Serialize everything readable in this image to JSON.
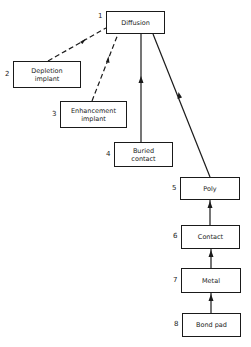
{
  "diagram": {
    "nodes": [
      {
        "id": "1",
        "label": "Diffusion"
      },
      {
        "id": "2",
        "label": "Depletion implant",
        "line1": "Depletion",
        "line2": "implant"
      },
      {
        "id": "3",
        "label": "Enhancement implant",
        "line1": "Enhancement",
        "line2": "implant"
      },
      {
        "id": "4",
        "label": "Buried contact",
        "line1": "Buried",
        "line2": "contact"
      },
      {
        "id": "5",
        "label": "Poly"
      },
      {
        "id": "6",
        "label": "Contact"
      },
      {
        "id": "7",
        "label": "Metal"
      },
      {
        "id": "8",
        "label": "Bond pad"
      }
    ],
    "edges": [
      {
        "from": "2",
        "to": "1",
        "style": "dashed"
      },
      {
        "from": "3",
        "to": "1",
        "style": "dashed"
      },
      {
        "from": "4",
        "to": "1",
        "style": "solid"
      },
      {
        "from": "5",
        "to": "1",
        "style": "solid"
      },
      {
        "from": "6",
        "to": "5",
        "style": "solid"
      },
      {
        "from": "7",
        "to": "6",
        "style": "solid"
      },
      {
        "from": "8",
        "to": "7",
        "style": "solid"
      }
    ]
  }
}
